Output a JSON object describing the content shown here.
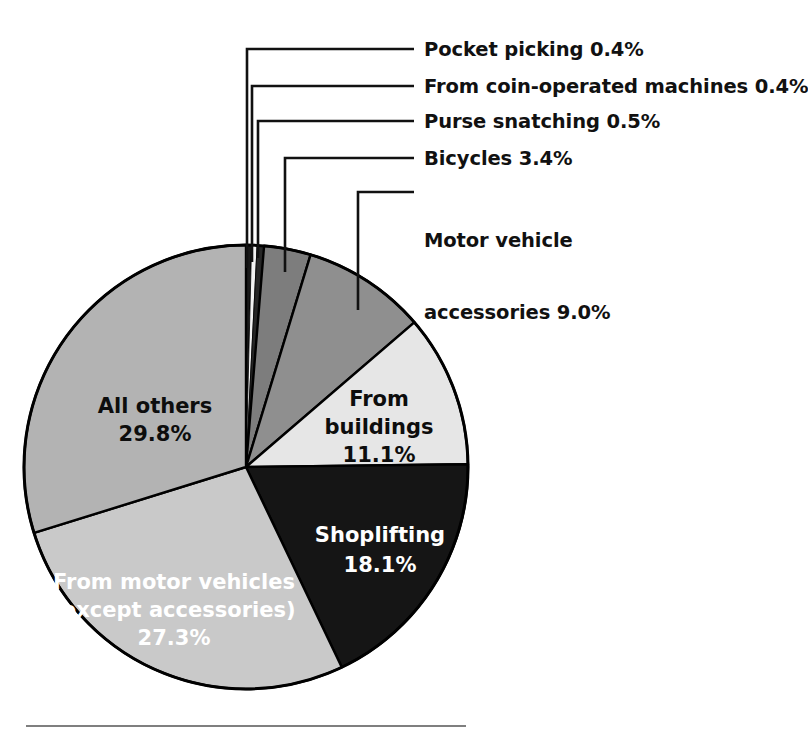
{
  "chart_data": {
    "type": "pie",
    "title": "",
    "subtitle": "",
    "xlabel": "",
    "ylabel": "",
    "legend_position": "callouts",
    "grid": false,
    "units": "percent",
    "total": 100.0,
    "start_angle_deg": 0,
    "direction": "clockwise",
    "categories": [
      "Pocket picking",
      "From coin-operated machines",
      "Purse snatching",
      "Bicycles",
      "Motor vehicle accessories",
      "From buildings",
      "Shoplifting",
      "From motor vehicles (except accessories)",
      "All others"
    ],
    "values": [
      0.4,
      0.4,
      0.5,
      3.4,
      9.0,
      11.1,
      18.1,
      27.3,
      29.8
    ],
    "slices": [
      {
        "id": "pocket-picking",
        "label": "Pocket picking",
        "value": 0.4,
        "value_text": "0.4%",
        "callout_text": "Pocket picking 0.4%",
        "fill": "#1a1a1a",
        "label_placement": "callout"
      },
      {
        "id": "coin-operated-machines",
        "label": "From coin-operated machines",
        "value": 0.4,
        "value_text": "0.4%",
        "callout_text": "From coin-operated machines 0.4%",
        "fill": "#f2f2f2",
        "label_placement": "callout"
      },
      {
        "id": "purse-snatching",
        "label": "Purse snatching",
        "value": 0.5,
        "value_text": "0.5%",
        "callout_text": "Purse snatching 0.5%",
        "fill": "#262626",
        "label_placement": "callout"
      },
      {
        "id": "bicycles",
        "label": "Bicycles",
        "value": 3.4,
        "value_text": "3.4%",
        "callout_text": "Bicycles 3.4%",
        "fill": "#7d7d7d",
        "label_placement": "callout"
      },
      {
        "id": "motor-vehicle-accessories",
        "label": "Motor vehicle accessories",
        "value": 9.0,
        "value_text": "9.0%",
        "callout_text": "Motor vehicle\naccessories 9.0%",
        "callout_line1": "Motor vehicle",
        "callout_line2": "accessories 9.0%",
        "fill": "#8f8f8f",
        "label_placement": "callout"
      },
      {
        "id": "from-buildings",
        "label": "From buildings",
        "value": 11.1,
        "value_text": "11.1%",
        "inside_line1": "From",
        "inside_line2": "buildings",
        "inside_line3": "11.1%",
        "fill": "#e6e6e6",
        "text_color": "#0d0d0d",
        "label_placement": "inside"
      },
      {
        "id": "shoplifting",
        "label": "Shoplifting",
        "value": 18.1,
        "value_text": "18.1%",
        "inside_line1": "Shoplifting",
        "inside_line2": "18.1%",
        "fill": "#151515",
        "text_color": "#ffffff",
        "label_placement": "inside"
      },
      {
        "id": "from-motor-vehicles",
        "label": "From motor vehicles (except accessories)",
        "value": 27.3,
        "value_text": "27.3%",
        "inside_line1": "From motor vehicles",
        "inside_line2": "(except accessories)",
        "inside_line3": "27.3%",
        "fill": "#c9c9c9",
        "text_color": "#ffffff",
        "label_placement": "inside"
      },
      {
        "id": "all-others",
        "label": "All others",
        "value": 29.8,
        "value_text": "29.8%",
        "inside_line1": "All others",
        "inside_line2": "29.8%",
        "fill": "#b3b3b3",
        "text_color": "#0d0d0d",
        "label_placement": "inside"
      }
    ]
  },
  "colors": {
    "outline": "#000000",
    "background": "#ffffff",
    "leader_line": "#111111",
    "rule": "#555555"
  },
  "footer": {
    "rule_visible": true
  }
}
